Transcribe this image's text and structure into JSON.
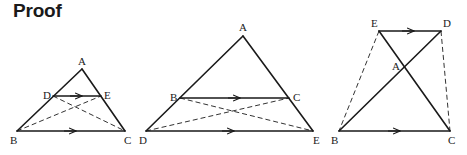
{
  "title": "Proof",
  "figures": [
    {
      "id": "figure-1",
      "labels": {
        "A": "A",
        "B": "B",
        "C": "C",
        "D": "D",
        "E": "E"
      },
      "solid_segments": [
        "AB",
        "AC",
        "BC",
        "DE"
      ],
      "dashed_segments": [
        "BE",
        "DC"
      ],
      "parallel_marks": [
        "DE",
        "BC"
      ]
    },
    {
      "id": "figure-2",
      "labels": {
        "A": "A",
        "B": "B",
        "C": "C",
        "D": "D",
        "E": "E"
      },
      "solid_segments": [
        "AD",
        "AE",
        "DE",
        "BC"
      ],
      "dashed_segments": [
        "DC",
        "BE"
      ],
      "parallel_marks": [
        "BC",
        "DE"
      ]
    },
    {
      "id": "figure-3",
      "labels": {
        "A": "A",
        "B": "B",
        "C": "C",
        "D": "D",
        "E": "E"
      },
      "solid_segments": [
        "ED",
        "EC",
        "DB",
        "BC"
      ],
      "dashed_segments": [
        "EB",
        "DC"
      ],
      "parallel_marks": [
        "ED",
        "BC"
      ]
    }
  ]
}
